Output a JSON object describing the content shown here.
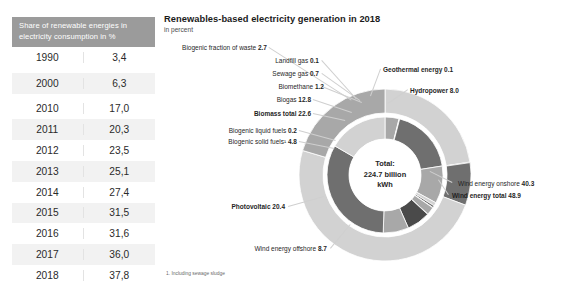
{
  "table": {
    "header": "Share of renewable energies in electricity consumption in %",
    "rows": [
      {
        "year": "1990",
        "value": "3,4"
      },
      {
        "year": "2000",
        "value": "6,3"
      },
      {
        "year": "2010",
        "value": "17,0"
      },
      {
        "year": "2011",
        "value": "20,3"
      },
      {
        "year": "2012",
        "value": "23,5"
      },
      {
        "year": "2013",
        "value": "25,1"
      },
      {
        "year": "2014",
        "value": "27,4"
      },
      {
        "year": "2015",
        "value": "31,5"
      },
      {
        "year": "2016",
        "value": "31,6"
      },
      {
        "year": "2017",
        "value": "36,0"
      },
      {
        "year": "2018",
        "value": "37,8"
      }
    ]
  },
  "chart": {
    "title": "Renewables-based electricity generation in 2018",
    "subtitle": "in percent",
    "footnote": "1. Including sewage sludge",
    "center": {
      "line1": "Total:",
      "line2": "224.7 billion",
      "line3": "kWh"
    }
  },
  "labels": {
    "biogenic_fraction_waste": {
      "name": "Biogenic fraction of waste",
      "value": "2.7"
    },
    "landfill_gas": {
      "name": "Landfill gas",
      "value": "0.1"
    },
    "sewage_gas": {
      "name": "Sewage gas",
      "value": "0.7"
    },
    "biomethane": {
      "name": "Biomethane",
      "value": "1.2"
    },
    "biogas": {
      "name": "Biogas",
      "value": "12.8"
    },
    "biomass_total": {
      "name": "Biomass total",
      "value": "22.6"
    },
    "biogenic_liquid_fuels": {
      "name": "Biogenic liquid fuels",
      "value": "0.2"
    },
    "biogenic_solid_fuels": {
      "name": "Biogenic solid fuels¹",
      "value": "4.8"
    },
    "photovoltaic": {
      "name": "Photovoltaic",
      "value": "20.4"
    },
    "wind_offshore": {
      "name": "Wind energy offshore",
      "value": "8.7"
    },
    "wind_onshore": {
      "name": "Wind energy onshore",
      "value": "40.3"
    },
    "wind_total": {
      "name": "Wind energy total",
      "value": "48.9"
    },
    "geothermal": {
      "name": "Geothermal energy",
      "value": "0.1"
    },
    "hydropower": {
      "name": "Hydropower",
      "value": "8.0"
    }
  },
  "colors": {
    "header_bg": "#9b9b9b",
    "row_alt_bg": "#f2f2f2",
    "ring_light": "#d2d2d2",
    "ring_mid": "#a8a8a8",
    "ring_dark": "#6f6f6f",
    "ring_darkest": "#4a4a4a",
    "leader": "#cfcfcf"
  },
  "chart_data": {
    "type": "pie",
    "title": "Renewables-based electricity generation in 2018",
    "subtitle": "in percent",
    "unit": "percent",
    "total_label": "Total: 224.7 billion kWh",
    "total_value": 224.7,
    "total_unit": "billion kWh",
    "legend": "none",
    "rings": [
      {
        "name": "outer",
        "description": "aggregate renewable energy sources",
        "categories": [
          "Biomass total",
          "Geothermal energy",
          "Hydropower",
          "Wind energy total",
          "Photovoltaic"
        ],
        "values": [
          22.6,
          0.1,
          8.0,
          48.9,
          20.4
        ]
      },
      {
        "name": "inner",
        "description": "detailed breakdown of renewable energy sources",
        "categories": [
          "Biogenic solid fuels¹",
          "Biogenic liquid fuels",
          "Biomass total",
          "Biogas",
          "Biomethane",
          "Sewage gas",
          "Landfill gas",
          "Biogenic fraction of waste",
          "Geothermal energy",
          "Hydropower",
          "Wind energy offshore",
          "Wind energy onshore",
          "Photovoltaic"
        ],
        "values": [
          4.8,
          0.2,
          22.6,
          12.8,
          1.2,
          0.7,
          0.1,
          2.7,
          0.1,
          8.0,
          8.7,
          40.3,
          20.4
        ]
      }
    ]
  }
}
